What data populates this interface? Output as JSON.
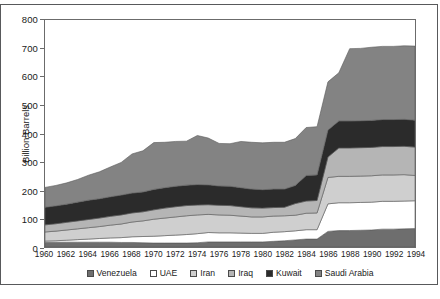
{
  "chart_data": {
    "type": "area",
    "stacked": true,
    "title": "",
    "subtitle": "",
    "xlabel": "",
    "ylabel": "Billion Barrels",
    "ylim": [
      0,
      800
    ],
    "ytick_step": 100,
    "yticks": [
      0,
      100,
      200,
      300,
      400,
      500,
      600,
      700,
      800
    ],
    "xlim": [
      1960,
      1994
    ],
    "xticks": [
      1960,
      1962,
      1964,
      1966,
      1968,
      1970,
      1972,
      1974,
      1976,
      1978,
      1980,
      1982,
      1984,
      1986,
      1988,
      1990,
      1992,
      1994
    ],
    "grid": false,
    "legend_position": "bottom",
    "x": [
      1960,
      1961,
      1962,
      1963,
      1964,
      1965,
      1966,
      1967,
      1968,
      1969,
      1970,
      1971,
      1972,
      1973,
      1974,
      1975,
      1976,
      1977,
      1978,
      1979,
      1980,
      1981,
      1982,
      1983,
      1984,
      1985,
      1986,
      1987,
      1988,
      1989,
      1990,
      1991,
      1992,
      1993,
      1994
    ],
    "series": [
      {
        "name": "Venezuela",
        "color": "#6e6e6e",
        "order": 1,
        "values": [
          17,
          17,
          17,
          17,
          17,
          17,
          17,
          16,
          16,
          15,
          14,
          14,
          14,
          14,
          15,
          18,
          18,
          18,
          18,
          18,
          18,
          20,
          22,
          25,
          28,
          28,
          55,
          58,
          58,
          59,
          60,
          63,
          63,
          64,
          65
        ]
      },
      {
        "name": "UAE",
        "color": "#ffffff",
        "order": 2,
        "values": [
          4,
          5,
          7,
          9,
          11,
          13,
          15,
          17,
          20,
          22,
          24,
          26,
          28,
          30,
          32,
          33,
          32,
          32,
          31,
          30,
          30,
          32,
          32,
          32,
          33,
          33,
          97,
          98,
          98,
          98,
          98,
          98,
          98,
          98,
          98
        ]
      },
      {
        "name": "Iran",
        "color": "#cfcfcf",
        "order": 3,
        "values": [
          32,
          34,
          36,
          38,
          40,
          42,
          45,
          48,
          52,
          55,
          60,
          62,
          64,
          66,
          66,
          64,
          63,
          62,
          60,
          58,
          58,
          57,
          56,
          55,
          58,
          59,
          93,
          93,
          93,
          93,
          93,
          93,
          93,
          93,
          89
        ]
      },
      {
        "name": "Iraq",
        "color": "#b5b5b5",
        "order": 4,
        "values": [
          25,
          26,
          27,
          28,
          29,
          30,
          31,
          32,
          32,
          32,
          33,
          35,
          36,
          36,
          35,
          34,
          34,
          34,
          33,
          32,
          31,
          30,
          30,
          41,
          43,
          44,
          72,
          100,
          100,
          100,
          100,
          100,
          100,
          100,
          100
        ]
      },
      {
        "name": "Kuwait",
        "color": "#2b2b2b",
        "order": 5,
        "values": [
          62,
          63,
          64,
          66,
          68,
          68,
          69,
          70,
          70,
          70,
          72,
          72,
          72,
          72,
          72,
          70,
          68,
          68,
          67,
          66,
          65,
          65,
          64,
          64,
          90,
          90,
          95,
          95,
          95,
          95,
          95,
          95,
          95,
          95,
          95
        ]
      },
      {
        "name": "Saudi Arabia",
        "color": "#838383",
        "order": 6,
        "values": [
          70,
          72,
          75,
          80,
          88,
          95,
          105,
          115,
          138,
          145,
          165,
          160,
          158,
          155,
          173,
          165,
          150,
          150,
          163,
          165,
          165,
          165,
          165,
          165,
          169,
          170,
          170,
          170,
          255,
          255,
          258,
          258,
          258,
          259,
          261
        ]
      }
    ],
    "totals_note": ""
  },
  "axis": {
    "y_label": "Billion Barrels",
    "y_ticks": [
      "800",
      "700",
      "600",
      "500",
      "400",
      "300",
      "200",
      "100",
      "0"
    ],
    "x_ticks": [
      "1960",
      "1962",
      "1964",
      "1966",
      "1968",
      "1970",
      "1972",
      "1974",
      "1976",
      "1978",
      "1980",
      "1982",
      "1984",
      "1986",
      "1988",
      "1990",
      "1992",
      "1994"
    ]
  },
  "legend": {
    "items": [
      {
        "label": "Venezuela",
        "color": "#6e6e6e"
      },
      {
        "label": "UAE",
        "color": "#ffffff"
      },
      {
        "label": "Iran",
        "color": "#cfcfcf"
      },
      {
        "label": "Iraq",
        "color": "#b5b5b5"
      },
      {
        "label": "Kuwait",
        "color": "#2b2b2b"
      },
      {
        "label": "Saudi Arabia",
        "color": "#838383"
      }
    ]
  },
  "caption": ""
}
